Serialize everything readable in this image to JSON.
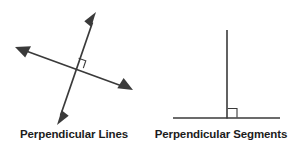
{
  "figure": {
    "background_color": "#ffffff",
    "stroke_color": "#3a3a3a",
    "text_color": "#1c1c1c",
    "panels": [
      {
        "id": "perpendicular-lines",
        "caption": "Perpendicular Lines",
        "shape_kind": "two-intersecting-double-headed-arrows",
        "right_angle_marker": true,
        "right_angle_marker_quadrant": "upper-right",
        "intersection_point": [
          71,
          67
        ],
        "elements": [
          {
            "name": "line-steep",
            "kind": "line-with-arrowheads-both-ends",
            "from": [
              57,
              125
            ],
            "to": [
              96,
              12
            ],
            "arrowheads": [
              "start",
              "end"
            ]
          },
          {
            "name": "line-shallow",
            "kind": "line-with-arrowheads-both-ends",
            "from": [
              15,
              47
            ],
            "to": [
              133,
              90
            ],
            "arrowheads": [
              "start",
              "end"
            ]
          }
        ]
      },
      {
        "id": "perpendicular-segments",
        "caption": "Perpendicular Segments",
        "shape_kind": "vertical-segment-meeting-horizontal-segment",
        "right_angle_marker": true,
        "right_angle_marker_quadrant": "lower-right",
        "intersection_point": [
          80,
          118
        ],
        "elements": [
          {
            "name": "segment-vertical",
            "kind": "plain-segment",
            "from": [
              80,
              30
            ],
            "to": [
              80,
              118
            ],
            "arrowheads": []
          },
          {
            "name": "segment-horizontal",
            "kind": "plain-segment",
            "from": [
              26,
              118
            ],
            "to": [
              133,
              118
            ],
            "arrowheads": []
          }
        ]
      }
    ]
  }
}
